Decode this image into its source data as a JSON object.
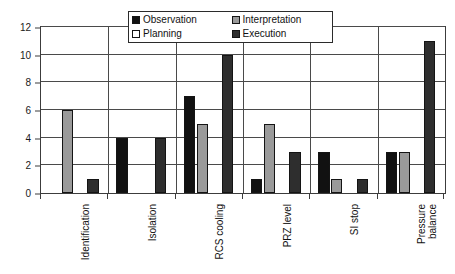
{
  "chart_data": {
    "type": "bar",
    "title": "",
    "subtitle": "",
    "xlabel": "",
    "ylabel": "",
    "ylim": [
      0,
      12
    ],
    "yticks": [
      0,
      2,
      4,
      6,
      8,
      10,
      12
    ],
    "grid": true,
    "legend_position": "top-center",
    "categories": [
      "Identification",
      "Isolation",
      "RCS cooling",
      "PRZ level",
      "SI stop",
      "Pressure balance"
    ],
    "series": [
      {
        "name": "Observation",
        "color": "#111111",
        "values": [
          0,
          4,
          7,
          1,
          3,
          3
        ]
      },
      {
        "name": "Interpretation",
        "color": "#9a9a9a",
        "values": [
          6,
          0,
          5,
          5,
          1,
          3
        ]
      },
      {
        "name": "Planning",
        "color": "#ffffff",
        "values": [
          0,
          0,
          0,
          0,
          0,
          0
        ]
      },
      {
        "name": "Execution",
        "color": "#2e2e2e",
        "values": [
          1,
          4,
          10,
          3,
          1,
          11
        ]
      }
    ]
  },
  "legend": {
    "items": [
      {
        "label": "Observation",
        "series_key": "s-observation"
      },
      {
        "label": "Interpretation",
        "series_key": "s-interpretation"
      },
      {
        "label": "Planning",
        "series_key": "s-planning"
      },
      {
        "label": "Execution",
        "series_key": "s-execution"
      }
    ]
  }
}
